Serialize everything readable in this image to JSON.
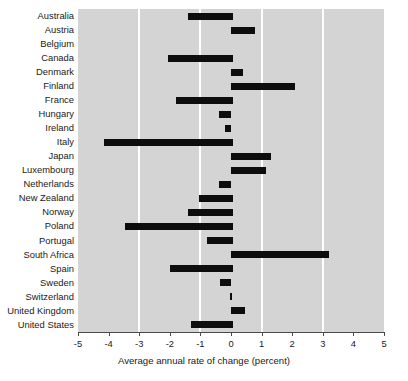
{
  "chart_data": {
    "type": "bar",
    "orientation": "horizontal",
    "title": "",
    "subtitle": "",
    "xlabel": "Average annual rate of change (percent)",
    "ylabel": "",
    "xlim": [
      -5,
      5
    ],
    "xticks": [
      -5,
      -4,
      -3,
      -2,
      -1,
      0,
      1,
      2,
      3,
      4,
      5
    ],
    "xtick_labels": [
      "-5",
      "-4",
      "-3",
      "-2",
      "-1",
      "0",
      "1",
      "2",
      "3",
      "4",
      "5"
    ],
    "gridlines_x": [
      -3,
      -1,
      1,
      3
    ],
    "grid": true,
    "legend": null,
    "plot_background": "#d4d4d4",
    "bar_color": "#0d0d0d",
    "gridline_color": "#ffffff",
    "categories": [
      "Australia",
      "Austria",
      "Belgium",
      "Canada",
      "Denmark",
      "Finland",
      "France",
      "Hungary",
      "Ireland",
      "Italy",
      "Japan",
      "Luxembourg",
      "Netherlands",
      "New Zealand",
      "Norway",
      "Poland",
      "Portugal",
      "South Africa",
      "Spain",
      "Sweden",
      "Switzerland",
      "United Kingdom",
      "United States"
    ],
    "values": [
      -1.4,
      0.8,
      0.0,
      -2.05,
      0.4,
      2.1,
      -1.8,
      -0.4,
      -0.2,
      -4.15,
      1.3,
      1.15,
      -0.4,
      -1.05,
      -1.4,
      -3.45,
      -0.8,
      3.2,
      -2.0,
      -0.35,
      0.05,
      0.45,
      -1.3
    ],
    "bars": [
      {
        "category": "Australia",
        "start": -1.4,
        "end": 0.05
      },
      {
        "category": "Austria",
        "start": 0.0,
        "end": 0.8
      },
      {
        "category": "Belgium",
        "start": 0.0,
        "end": 0.0
      },
      {
        "category": "Canada",
        "start": -2.05,
        "end": 0.05
      },
      {
        "category": "Denmark",
        "start": 0.0,
        "end": 0.4
      },
      {
        "category": "Finland",
        "start": 0.0,
        "end": 2.1
      },
      {
        "category": "France",
        "start": -1.8,
        "end": 0.05
      },
      {
        "category": "Hungary",
        "start": -0.4,
        "end": 0.0
      },
      {
        "category": "Ireland",
        "start": -0.2,
        "end": 0.0
      },
      {
        "category": "Italy",
        "start": -4.15,
        "end": 0.05
      },
      {
        "category": "Japan",
        "start": 0.0,
        "end": 1.3
      },
      {
        "category": "Luxembourg",
        "start": 0.0,
        "end": 1.15
      },
      {
        "category": "Netherlands",
        "start": -0.4,
        "end": 0.0
      },
      {
        "category": "New Zealand",
        "start": -1.05,
        "end": 0.05
      },
      {
        "category": "Norway",
        "start": -1.4,
        "end": 0.05
      },
      {
        "category": "Poland",
        "start": -3.45,
        "end": 0.05
      },
      {
        "category": "Portugal",
        "start": -0.8,
        "end": 0.05
      },
      {
        "category": "South Africa",
        "start": 0.0,
        "end": 3.2
      },
      {
        "category": "Spain",
        "start": -2.0,
        "end": 0.05
      },
      {
        "category": "Sweden",
        "start": -0.35,
        "end": 0.0
      },
      {
        "category": "Switzerland",
        "start": -0.02,
        "end": 0.02
      },
      {
        "category": "United Kingdom",
        "start": 0.0,
        "end": 0.45
      },
      {
        "category": "United States",
        "start": -1.3,
        "end": 0.05
      }
    ]
  }
}
